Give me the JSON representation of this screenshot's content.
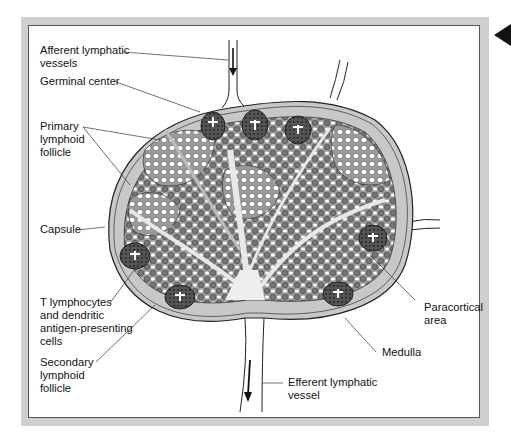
{
  "figure": {
    "colors": {
      "frame": "#cfcfcf",
      "capsule": "#c9c9c9",
      "cell_dark": "#7a7a7a",
      "cell_light": "#ffffff",
      "germinal": "#4a4a4a",
      "medulla": "#e8e8e8"
    },
    "pointer_icon": "triangle-left"
  },
  "labels": {
    "afferent": "Afferent lymphatic\nvessels",
    "germinal_center": "Germinal center",
    "primary_follicle": "Primary\nlymphoid\nfollicle",
    "capsule": "Capsule",
    "t_lymphocytes": "T lymphocytes\nand dendritic\nantigen-presenting\ncells",
    "secondary_follicle": "Secondary\nlymphoid\nfollicle",
    "paracortical": "Paracortical\narea",
    "medulla": "Medulla",
    "efferent": "Efferent lymphatic\nvessel"
  }
}
